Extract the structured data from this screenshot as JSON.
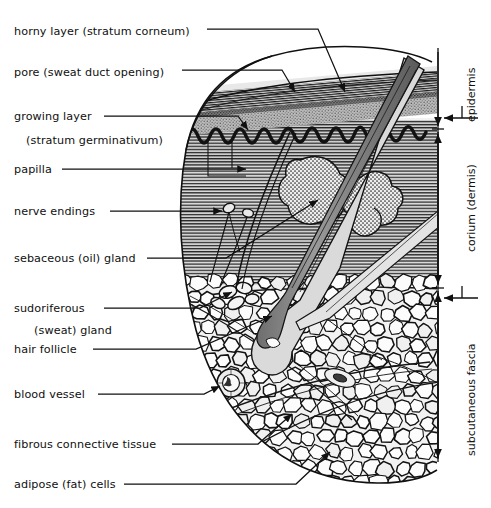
{
  "figure": {
    "background": "#ffffff",
    "ink": "#101010"
  },
  "left_labels": [
    {
      "id": "horny-layer",
      "text": "horny layer  (stratum corneum)",
      "x": 14,
      "y": 33
    },
    {
      "id": "pore",
      "text": "pore (sweat duct opening)",
      "x": 14,
      "y": 74
    },
    {
      "id": "growing-layer",
      "text": "growing layer",
      "x": 14,
      "y": 120
    },
    {
      "id": "stratum-germinativum",
      "text": "(stratum germinativum)",
      "x": 26,
      "y": 144
    },
    {
      "id": "papilla",
      "text": "papilla",
      "x": 14,
      "y": 173
    },
    {
      "id": "nerve-endings",
      "text": "nerve endings",
      "x": 14,
      "y": 215
    },
    {
      "id": "sebaceous-gland",
      "text": "sebaceous (oil) gland",
      "x": 14,
      "y": 262
    },
    {
      "id": "sudoriferous",
      "text": "sudoriferous",
      "x": 14,
      "y": 312
    },
    {
      "id": "sweat-gland",
      "text": "(sweat) gland",
      "x": 34,
      "y": 334
    },
    {
      "id": "hair-follicle",
      "text": "hair follicle",
      "x": 14,
      "y": 353
    },
    {
      "id": "blood-vessel",
      "text": "blood vessel",
      "x": 14,
      "y": 398
    },
    {
      "id": "fibrous-tissue",
      "text": "fibrous connective tissue",
      "x": 14,
      "y": 448
    },
    {
      "id": "adipose-cells",
      "text": "adipose (fat) cells",
      "x": 14,
      "y": 488
    }
  ],
  "right_brackets": [
    {
      "id": "epidermis",
      "text": "epidermis",
      "top": 48,
      "bottom": 129
    },
    {
      "id": "corium",
      "text": "corium (dermis)",
      "top": 129,
      "bottom": 288
    },
    {
      "id": "subcutaneous-fascia",
      "text": "subcutaneous fascia",
      "top": 288,
      "bottom": 462
    }
  ],
  "layers": {
    "stratum_corneum": "horny layer",
    "granular": "granular layer",
    "germinativum": "growing layer",
    "dermis": "corium (dermis)",
    "subcutaneous": "subcutaneous fascia"
  },
  "structures": [
    "hair shaft",
    "hair follicle",
    "hair bulb",
    "sebaceous (oil) gland",
    "sudoriferous (sweat) gland",
    "sweat duct",
    "pore",
    "papilla",
    "nerve endings",
    "blood vessel",
    "fibrous connective tissue",
    "adipose (fat) cells"
  ]
}
